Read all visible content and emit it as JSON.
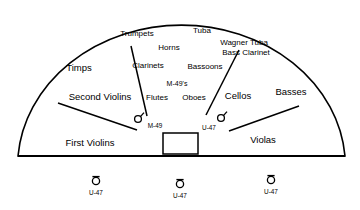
{
  "diagram": {
    "stage": {
      "shape": "semicircle",
      "outline_color": "#000000",
      "fill_color": "#ffffff",
      "baseline_label": "stage-front-edge"
    },
    "podium": {
      "name": "conductor-podium",
      "shape": "rectangle"
    },
    "sections": [
      {
        "id": "timps",
        "label": "Timps",
        "size": "lg",
        "x": 79,
        "y": 68
      },
      {
        "id": "trumpets",
        "label": "Trumpets",
        "size": "md",
        "x": 137,
        "y": 34
      },
      {
        "id": "tuba",
        "label": "Tuba",
        "size": "md",
        "x": 202,
        "y": 31
      },
      {
        "id": "horns",
        "label": "Horns",
        "size": "md",
        "x": 169,
        "y": 48
      },
      {
        "id": "wagner-tuba",
        "label": "Wagner Tuba",
        "size": "md",
        "x": 244,
        "y": 43
      },
      {
        "id": "bass-clarinet",
        "label": "Bass Clarinet",
        "size": "md",
        "x": 246,
        "y": 53
      },
      {
        "id": "clarinets",
        "label": "Clarinets",
        "size": "md",
        "x": 148,
        "y": 66
      },
      {
        "id": "bassoons",
        "label": "Bassoons",
        "size": "md",
        "x": 205,
        "y": 67
      },
      {
        "id": "m49s",
        "label": "M-49's",
        "size": "sm",
        "x": 177,
        "y": 83
      },
      {
        "id": "second-violins",
        "label": "Second Violins",
        "size": "lg",
        "x": 100,
        "y": 97
      },
      {
        "id": "flutes",
        "label": "Flutes",
        "size": "md",
        "x": 157,
        "y": 98
      },
      {
        "id": "oboes",
        "label": "Oboes",
        "size": "md",
        "x": 194,
        "y": 98
      },
      {
        "id": "cellos",
        "label": "Cellos",
        "size": "lg",
        "x": 238,
        "y": 96
      },
      {
        "id": "basses",
        "label": "Basses",
        "size": "lg",
        "x": 291,
        "y": 92
      },
      {
        "id": "first-violins",
        "label": "First Violins",
        "size": "lg",
        "x": 90,
        "y": 143
      },
      {
        "id": "violas",
        "label": "Violas",
        "size": "lg",
        "x": 263,
        "y": 140
      }
    ],
    "stage_microphones": [
      {
        "id": "mic-m49-stage",
        "label": "M-49",
        "type": "M-49",
        "cx": 138,
        "cy": 119,
        "label_x": 155,
        "label_y": 126
      },
      {
        "id": "mic-u47-stage",
        "label": "U-47",
        "type": "U-47",
        "cx": 221,
        "cy": 118,
        "label_x": 209,
        "label_y": 128
      }
    ],
    "front_microphones": [
      {
        "id": "mic-u47-left",
        "label": "U-47",
        "type": "U-47",
        "cx": 96,
        "cy": 181,
        "label_x": 96,
        "label_y": 193
      },
      {
        "id": "mic-u47-center",
        "label": "U-47",
        "type": "U-47",
        "cx": 180,
        "cy": 184,
        "label_x": 180,
        "label_y": 196
      },
      {
        "id": "mic-u47-right",
        "label": "U-47",
        "type": "U-47",
        "cx": 271,
        "cy": 180,
        "label_x": 271,
        "label_y": 192
      }
    ],
    "leader_lines": [
      {
        "id": "line-clarinets-to-m49",
        "x1": 131,
        "y1": 46,
        "x2": 147,
        "y2": 116
      },
      {
        "id": "line-bassclarinet-to-u47",
        "x1": 239,
        "y1": 50,
        "x2": 206,
        "y2": 115
      },
      {
        "id": "line-second-to-first-violins",
        "x1": 58,
        "y1": 103,
        "x2": 137,
        "y2": 130
      },
      {
        "id": "line-basses-to-violas",
        "x1": 299,
        "y1": 106,
        "x2": 229,
        "y2": 131
      }
    ]
  }
}
